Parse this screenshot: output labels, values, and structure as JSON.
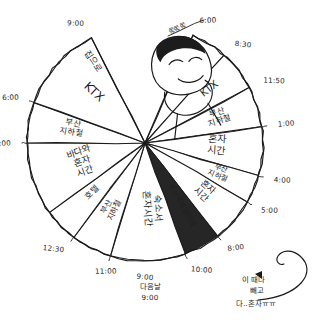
{
  "meta": {
    "background_color": "#ffffff",
    "ink_color": "#1a1a1a",
    "dark_slice_color": "#262626"
  },
  "annotations": {
    "top_label": "쫑쫑쫑",
    "bottom_next_day": "다음날",
    "bottom_next_day_time": "9:00",
    "callout_line1": "이 때나",
    "callout_line2": "빼고",
    "callout_line3": "다..혼자ㅠㅠ"
  },
  "doodle": {
    "name": "sleeping-head-doodle",
    "description": "cartoon head with black hair lying on its side, eyes closed"
  },
  "chart_data": {
    "type": "pie",
    "center": {
      "x": 145,
      "y": 143
    },
    "radius": 118,
    "legend": "none",
    "grid": false,
    "tick_labels": [
      {
        "time": "6:00",
        "angle_deg": -66
      },
      {
        "time": "8:30",
        "angle_deg": -48
      },
      {
        "time": "11:50",
        "angle_deg": -28
      },
      {
        "time": "1:00",
        "angle_deg": -8
      },
      {
        "time": "4:00",
        "angle_deg": 16
      },
      {
        "time": "5:00",
        "angle_deg": 30
      },
      {
        "time": "8:00",
        "angle_deg": 52
      },
      {
        "time": "10:00",
        "angle_deg": 70
      },
      {
        "time": "9:00",
        "angle_deg": 90
      },
      {
        "time": "11:00",
        "angle_deg": 107
      },
      {
        "time": "12:30",
        "angle_deg": 127
      },
      {
        "time": "4:00",
        "angle_deg": 180
      },
      {
        "time": "6:00",
        "angle_deg": 200
      },
      {
        "time": "9:00",
        "angle_deg": 243
      }
    ],
    "categories": [
      "지하철",
      "KTX",
      "부산 지하철",
      "혼자 시간",
      "부산 지하철",
      "혼자 시간",
      "부산국제영화제",
      "숙소서 혼자시간",
      "부산 지하철",
      "호텔",
      "바다와 혼자 시간",
      "부산 지하철",
      "KTX",
      "집으로"
    ],
    "values": [
      18,
      20,
      20,
      24,
      14,
      22,
      22,
      18,
      20,
      17,
      53,
      20,
      43,
      0
    ],
    "slices": [
      {
        "label": "지하철",
        "start_deg": -66,
        "end_deg": -48,
        "dark": false,
        "text_angle": -57,
        "text_r": 88,
        "font": 6.6
      },
      {
        "label": "KTX",
        "start_deg": -48,
        "end_deg": -28,
        "dark": false,
        "text_angle": -38,
        "text_r": 84,
        "font": 10.5
      },
      {
        "label": "부산 지하철",
        "start_deg": -28,
        "end_deg": -8,
        "dark": false,
        "text_angle": -18,
        "text_r": 78,
        "font": 8.2
      },
      {
        "label": "혼자 시간",
        "start_deg": -8,
        "end_deg": 16,
        "dark": false,
        "text_angle": 4,
        "text_r": 72,
        "font": 10.0
      },
      {
        "label": "부산 지하철",
        "start_deg": 16,
        "end_deg": 30,
        "dark": false,
        "text_angle": 23,
        "text_r": 80,
        "font": 7.4
      },
      {
        "label": "혼자 시간",
        "start_deg": 30,
        "end_deg": 52,
        "dark": false,
        "text_angle": 41,
        "text_r": 76,
        "font": 9.0
      },
      {
        "label": "부산국제영화제",
        "start_deg": 52,
        "end_deg": 70,
        "dark": true,
        "text_angle": 61,
        "text_r": 72,
        "font": 7.6
      },
      {
        "label": "숙소서 혼자시간",
        "start_deg": 70,
        "end_deg": 107,
        "dark": false,
        "text_angle": 86,
        "text_r": 66,
        "font": 9.4
      },
      {
        "label": "부산 지하철",
        "start_deg": 107,
        "end_deg": 127,
        "dark": false,
        "text_angle": 116,
        "text_r": 74,
        "font": 8.0
      },
      {
        "label": "호텔",
        "start_deg": 127,
        "end_deg": 144,
        "dark": false,
        "text_angle": 135,
        "text_r": 72,
        "font": 8.4
      },
      {
        "label": "바다와 혼자 시간",
        "start_deg": 144,
        "end_deg": 180,
        "dark": false,
        "text_angle": 161,
        "text_r": 66,
        "font": 9.2
      },
      {
        "label": "부산 지하철",
        "start_deg": 180,
        "end_deg": 200,
        "dark": false,
        "text_angle": 190,
        "text_r": 74,
        "font": 8.2
      },
      {
        "label": "KTX",
        "start_deg": 200,
        "end_deg": 243,
        "dark": false,
        "text_angle": 222,
        "text_r": 72,
        "font": 12.0
      },
      {
        "label": "집으로",
        "start_deg": 243,
        "end_deg": 243,
        "dark": false,
        "text_angle": 236,
        "text_r": 97,
        "font": 8.6
      }
    ],
    "gap_sector": {
      "start_deg": -66,
      "end_deg": -117,
      "note": "open wedge at top occupied by the doodle"
    }
  }
}
